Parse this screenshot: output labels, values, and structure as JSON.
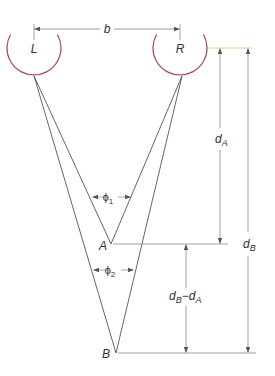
{
  "diagram": {
    "colors": {
      "eye": "#a8505c",
      "line": "#555555",
      "dim_line": "#888888",
      "top_ref_line": "#c8d890",
      "text": "#333333"
    },
    "eyes": {
      "left": {
        "label": "L",
        "cx": 34,
        "cy": 48,
        "r": 27
      },
      "right": {
        "label": "R",
        "cx": 180,
        "cy": 48,
        "r": 27
      }
    },
    "points": {
      "A": {
        "label": "A",
        "x": 111,
        "y": 244
      },
      "B": {
        "label": "B",
        "x": 116,
        "y": 353
      }
    },
    "dimensions": {
      "baseline": {
        "label": "b"
      },
      "depth_A": {
        "label_main": "d",
        "label_sub": "A"
      },
      "depth_B": {
        "label_main": "d",
        "label_sub": "B"
      },
      "depth_diff": {
        "label_main1": "d",
        "label_sub1": "B",
        "minus": "−",
        "label_main2": "d",
        "label_sub2": "A"
      }
    },
    "angles": {
      "phi1": {
        "symbol": "ϕ",
        "sub": "1"
      },
      "phi2": {
        "symbol": "ϕ",
        "sub": "2"
      }
    }
  }
}
